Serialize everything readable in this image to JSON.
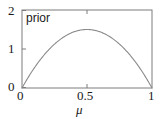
{
  "figure": {
    "background_color": "#ffffff",
    "frame_color": "#7d7d7d",
    "curve_color": "#8a8a8a",
    "text_color": "#1a1a1a"
  },
  "chart_data": {
    "type": "line",
    "title": "",
    "annotation": "prior",
    "xlabel": "μ",
    "ylabel": "",
    "xlim": [
      0,
      1
    ],
    "ylim": [
      0,
      2
    ],
    "xticks": [
      0,
      0.5,
      1
    ],
    "xtick_labels": [
      "0",
      "0.5",
      "1"
    ],
    "yticks": [
      0,
      1,
      2
    ],
    "ytick_labels": [
      "0",
      "1",
      "2"
    ],
    "grid": false,
    "legend": false,
    "series": [
      {
        "name": "prior",
        "distribution": "Beta(2,2)",
        "formula": "6*mu*(1-mu)",
        "color": "#8a8a8a",
        "x": [
          0.0,
          0.05,
          0.1,
          0.15,
          0.2,
          0.25,
          0.3,
          0.35,
          0.4,
          0.45,
          0.5,
          0.55,
          0.6,
          0.65,
          0.7,
          0.75,
          0.8,
          0.85,
          0.9,
          0.95,
          1.0
        ],
        "values": [
          0.0,
          0.285,
          0.54,
          0.765,
          0.96,
          1.125,
          1.26,
          1.365,
          1.44,
          1.485,
          1.5,
          1.485,
          1.44,
          1.365,
          1.26,
          1.125,
          0.96,
          0.765,
          0.54,
          0.285,
          0.0
        ]
      }
    ]
  },
  "labels": {
    "y_2": "2",
    "y_1": "1",
    "y_0": "0",
    "x_0": "0",
    "x_05": "0.5",
    "x_1": "1",
    "axis_x": "μ",
    "series_name": "prior"
  }
}
